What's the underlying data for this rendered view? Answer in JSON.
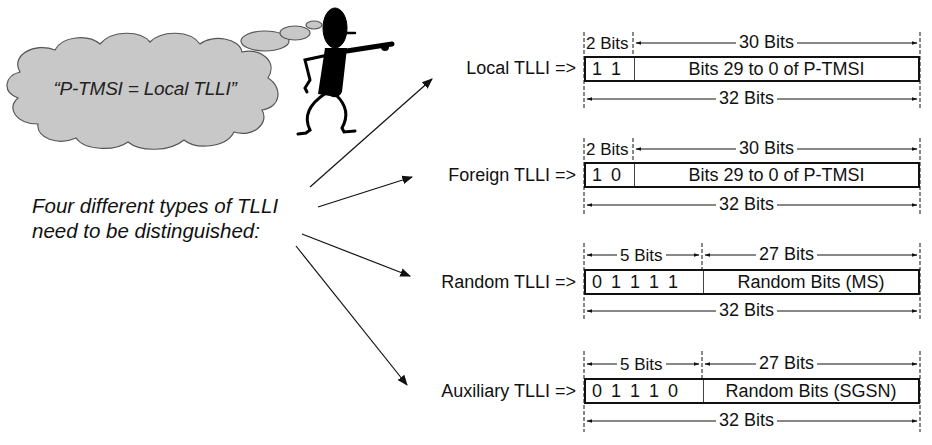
{
  "thought_bubble": {
    "text": "“P-TMSI = Local TLLI”",
    "fill": "#c8c8c8"
  },
  "intro": {
    "line1": "Four different types of TLLI",
    "line2": "need to be distinguished:"
  },
  "tlli_types": [
    {
      "label": "Local TLLI =>",
      "prefix_bits": [
        "1",
        "1"
      ],
      "prefix_width_label": "2 Bits",
      "rest_width_label": "30 Bits",
      "rest_text": "Bits 29 to 0 of P-TMSI",
      "total_label": "32 Bits"
    },
    {
      "label": "Foreign TLLI =>",
      "prefix_bits": [
        "1",
        "0"
      ],
      "prefix_width_label": "2 Bits",
      "rest_width_label": "30 Bits",
      "rest_text": "Bits 29 to 0 of P-TMSI",
      "total_label": "32 Bits"
    },
    {
      "label": "Random TLLI =>",
      "prefix_bits": [
        "0",
        "1",
        "1",
        "1",
        "1"
      ],
      "prefix_width_label": "5 Bits",
      "rest_width_label": "27 Bits",
      "rest_text": "Random Bits (MS)",
      "total_label": "32 Bits"
    },
    {
      "label": "Auxiliary TLLI =>",
      "prefix_bits": [
        "0",
        "1",
        "1",
        "1",
        "0"
      ],
      "prefix_width_label": "5 Bits",
      "rest_width_label": "27 Bits",
      "rest_text": "Random Bits (SGSN)",
      "total_label": "32 Bits"
    }
  ],
  "colors": {
    "line": "#111111",
    "cloud": "#c8c8c8",
    "cloud_outline": "#555555"
  }
}
